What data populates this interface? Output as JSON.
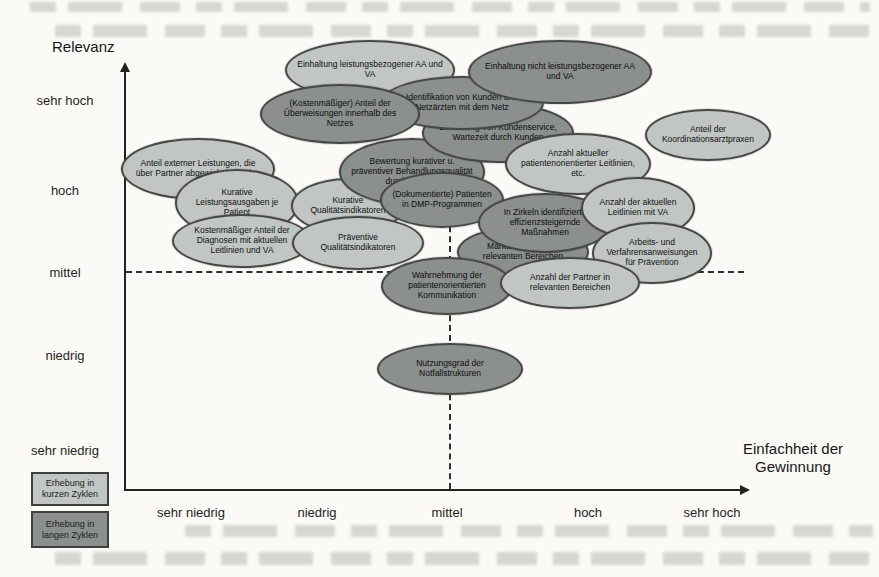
{
  "chart_data": {
    "type": "scatter",
    "title": "",
    "xlabel": "Einfachheit der Gewinnung",
    "ylabel": "Relevanz",
    "x_tick_labels": [
      "sehr niedrig",
      "niedrig",
      "mittel",
      "hoch",
      "sehr hoch"
    ],
    "y_tick_labels": [
      "sehr hoch",
      "hoch",
      "mittel",
      "niedrig",
      "sehr niedrig"
    ],
    "axis_scale_note": "qualitative scale 1=sehr niedrig ... 5=sehr hoch",
    "grid": "dashed reference lines at mittel/mittel",
    "legend_position": "bottom-left",
    "legend": [
      {
        "label": "Erhebung in kurzen Zyklen",
        "cycle": "kurz",
        "color": "#c1c5c3"
      },
      {
        "label": "Erhebung in langen Zyklen",
        "cycle": "lang",
        "color": "#8b8f8d"
      }
    ],
    "colors": {
      "light": "#c1c5c3",
      "dark": "#8b8f8d",
      "outline": "#474747",
      "page_bg": "#fbfaf6"
    },
    "points": [
      {
        "label": "Anteil externer Leistungen, die über Partner abgewickelt werden",
        "cycle": "kurz",
        "einfachheit": 1.1,
        "relevanz": 4.2,
        "px": {
          "cx": 198,
          "cy": 169,
          "rx": 77,
          "ry": 31,
          "z": 1
        }
      },
      {
        "label": "Einhaltung leistungsbezogener AA und VA",
        "cycle": "kurz",
        "einfachheit": 2.4,
        "relevanz": 5.3,
        "px": {
          "cx": 370,
          "cy": 70,
          "rx": 85,
          "ry": 30,
          "z": 2
        }
      },
      {
        "label": "Kurative Leistungsausgaben je Patient",
        "cycle": "kurz",
        "einfachheit": 1.4,
        "relevanz": 3.8,
        "px": {
          "cx": 237,
          "cy": 203,
          "rx": 62,
          "ry": 34,
          "z": 3
        }
      },
      {
        "label": "Kostenmäßiger Anteil der Diagnosen mit aktuellen Leitlinien und VA",
        "cycle": "kurz",
        "einfachheit": 1.4,
        "relevanz": 3.4,
        "px": {
          "cx": 242,
          "cy": 241,
          "rx": 70,
          "ry": 27,
          "z": 4
        }
      },
      {
        "label": "Kurative Qualitätsindikatoren",
        "cycle": "kurz",
        "einfachheit": 2.2,
        "relevanz": 3.8,
        "px": {
          "cx": 348,
          "cy": 206,
          "rx": 57,
          "ry": 28,
          "z": 5
        }
      },
      {
        "label": "Präventive Qualitätsindikatoren",
        "cycle": "kurz",
        "einfachheit": 2.3,
        "relevanz": 3.3,
        "px": {
          "cx": 358,
          "cy": 243,
          "rx": 66,
          "ry": 27,
          "z": 6
        }
      },
      {
        "label": "Bewertung kurativer u. präventiver Behandlungsqualität durch Kunden",
        "cycle": "lang",
        "einfachheit": 2.7,
        "relevanz": 4.2,
        "px": {
          "cx": 412,
          "cy": 172,
          "rx": 73,
          "ry": 34,
          "z": 7
        }
      },
      {
        "label": "Bewertung von Kundenservice, Wartezeit durch Kunden",
        "cycle": "lang",
        "einfachheit": 3.4,
        "relevanz": 4.6,
        "px": {
          "cx": 498,
          "cy": 133,
          "rx": 76,
          "ry": 30,
          "z": 8
        }
      },
      {
        "label": "Identifikation von Kunden und Netzärzten mit dem Netz",
        "cycle": "lang",
        "einfachheit": 3.1,
        "relevanz": 5.0,
        "px": {
          "cx": 462,
          "cy": 103,
          "rx": 82,
          "ry": 27,
          "z": 9
        }
      },
      {
        "label": "(Kostenmäßiger) Anteil der Überweisungen innerhalb des Netzes",
        "cycle": "lang",
        "einfachheit": 2.1,
        "relevanz": 4.8,
        "px": {
          "cx": 340,
          "cy": 114,
          "rx": 80,
          "ry": 30,
          "z": 10
        }
      },
      {
        "label": "Einhaltung nicht leistungsbezogener AA und VA",
        "cycle": "lang",
        "einfachheit": 3.8,
        "relevanz": 5.3,
        "px": {
          "cx": 560,
          "cy": 72,
          "rx": 92,
          "ry": 32,
          "z": 11
        }
      },
      {
        "label": "(Dokumentierte) Patienten in DMP-Programmen",
        "cycle": "lang",
        "einfachheit": 2.9,
        "relevanz": 3.9,
        "px": {
          "cx": 442,
          "cy": 200,
          "rx": 62,
          "ry": 28,
          "z": 12
        }
      },
      {
        "label": "Marktabdeckung in relevanten Bereichen",
        "cycle": "lang",
        "einfachheit": 3.5,
        "relevanz": 3.3,
        "px": {
          "cx": 523,
          "cy": 252,
          "rx": 66,
          "ry": 26,
          "z": 13
        }
      },
      {
        "label": "Anzahl aktueller patientenorientierter Leitlinien, etc.",
        "cycle": "kurz",
        "einfachheit": 4.0,
        "relevanz": 4.3,
        "px": {
          "cx": 578,
          "cy": 164,
          "rx": 73,
          "ry": 31,
          "z": 14
        }
      },
      {
        "label": "In Zirkeln identifizierte effizienzsteigernde Maßnahmen",
        "cycle": "lang",
        "einfachheit": 3.7,
        "relevanz": 3.6,
        "px": {
          "cx": 545,
          "cy": 223,
          "rx": 67,
          "ry": 30,
          "z": 15
        }
      },
      {
        "label": "Anzahl der aktuellen Leitlinien mit VA",
        "cycle": "kurz",
        "einfachheit": 4.4,
        "relevanz": 3.8,
        "px": {
          "cx": 638,
          "cy": 208,
          "rx": 57,
          "ry": 31,
          "z": 16
        }
      },
      {
        "label": "Arbeits- und Verfahrensanweisungen für Prävention",
        "cycle": "kurz",
        "einfachheit": 4.5,
        "relevanz": 3.3,
        "px": {
          "cx": 652,
          "cy": 253,
          "rx": 60,
          "ry": 31,
          "z": 17
        }
      },
      {
        "label": "Wahrnehmung der patientenorientierten Kommunikation",
        "cycle": "lang",
        "einfachheit": 3.0,
        "relevanz": 2.9,
        "px": {
          "cx": 447,
          "cy": 286,
          "rx": 66,
          "ry": 29,
          "z": 18
        }
      },
      {
        "label": "Anzahl der Partner in relevanten Bereichen",
        "cycle": "kurz",
        "einfachheit": 3.9,
        "relevanz": 2.9,
        "px": {
          "cx": 570,
          "cy": 283,
          "rx": 70,
          "ry": 26,
          "z": 19
        }
      },
      {
        "label": "Anteil der Koordinationsarztpraxen",
        "cycle": "kurz",
        "einfachheit": 5.0,
        "relevanz": 4.6,
        "px": {
          "cx": 708,
          "cy": 135,
          "rx": 63,
          "ry": 26,
          "z": 20
        }
      },
      {
        "label": "Nutzungsgrad der Notfallstrukturen",
        "cycle": "lang",
        "einfachheit": 3.0,
        "relevanz": 1.9,
        "px": {
          "cx": 450,
          "cy": 369,
          "rx": 73,
          "ry": 26,
          "z": 21
        }
      }
    ]
  }
}
